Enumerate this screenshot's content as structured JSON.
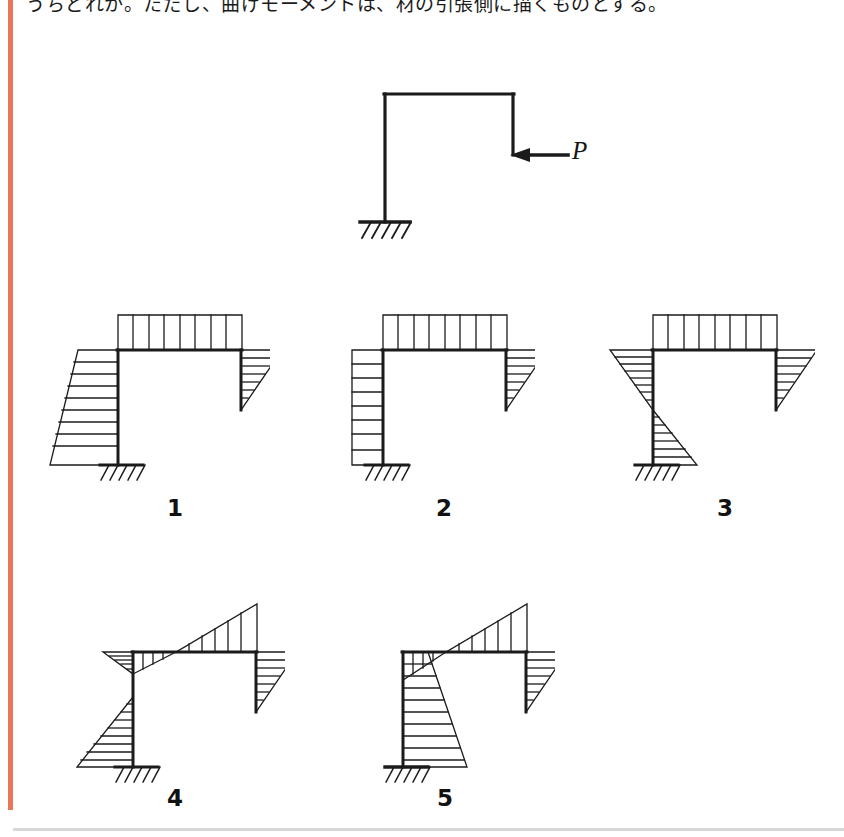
{
  "page": {
    "prompt": "うちどれか。ただし、曲げモーメントは、材の引張側に描くものとする。",
    "accent_color": "#e8775a",
    "ink_color": "#1b1b1b",
    "background": "#ffffff"
  },
  "figure": {
    "name": "cantilever-frame-with-load",
    "load_label": "P",
    "load_direction": "leftward-horizontal",
    "support_type": "fixed",
    "members": [
      "left-column",
      "top-beam",
      "right-hanging-column"
    ]
  },
  "options": [
    {
      "id": "1",
      "label": "1",
      "beam_diagram": "uniform-rectangle-above",
      "left_column_diagram": "trapezoid-left-widening-downward",
      "right_column_diagram": "triangle-right-max-at-top"
    },
    {
      "id": "2",
      "label": "2",
      "beam_diagram": "uniform-rectangle-above",
      "left_column_diagram": "uniform-rectangle-left",
      "right_column_diagram": "triangle-right-max-at-top"
    },
    {
      "id": "3",
      "label": "3",
      "beam_diagram": "uniform-rectangle-above",
      "left_column_diagram": "sign-change-triangles-left-then-right",
      "right_column_diagram": "triangle-right-max-at-top"
    },
    {
      "id": "4",
      "label": "4",
      "beam_diagram": "diagonal-crossing-small-below-left-large-above-right",
      "left_column_diagram": "sign-change-small-top-large-left-bottom",
      "right_column_diagram": "triangle-right-max-at-top"
    },
    {
      "id": "5",
      "label": "5",
      "beam_diagram": "diagonal-crossing-small-below-left-large-above-right",
      "left_column_diagram": "trapezoid-right-widening-downward",
      "right_column_diagram": "triangle-right-max-at-top"
    }
  ]
}
